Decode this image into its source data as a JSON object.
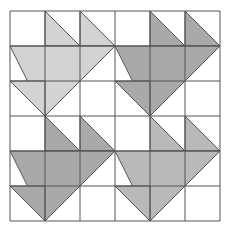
{
  "quilt": {
    "origin": [
      10,
      11
    ],
    "cell_size": 35,
    "grid_cells": 6,
    "line_color": "#555555",
    "background": "#ffffff",
    "blocks": [
      {
        "name": "block-top-left",
        "col": 0,
        "row": 0,
        "fill": "#d3d3d3"
      },
      {
        "name": "block-top-right",
        "col": 1,
        "row": 0,
        "fill": "#a9a9a9"
      },
      {
        "name": "block-bottom-left",
        "col": 0,
        "row": 1,
        "fill": "#a9a9a9"
      },
      {
        "name": "block-bottom-right",
        "col": 1,
        "row": 1,
        "fill": "#b9b9b9"
      }
    ],
    "block_shapes": [
      {
        "name": "small-triangle-top-middle",
        "points": [
          [
            1,
            0
          ],
          [
            1,
            1
          ],
          [
            2,
            1
          ]
        ]
      },
      {
        "name": "small-triangle-top-right",
        "points": [
          [
            2,
            0
          ],
          [
            2,
            1
          ],
          [
            3,
            1
          ]
        ]
      },
      {
        "name": "large-triangle",
        "points": [
          [
            0,
            1
          ],
          [
            3,
            1
          ],
          [
            1,
            3
          ]
        ]
      },
      {
        "name": "small-triangle-bottom-left",
        "points": [
          [
            0,
            2
          ],
          [
            1,
            2
          ],
          [
            1,
            3
          ]
        ]
      }
    ]
  }
}
